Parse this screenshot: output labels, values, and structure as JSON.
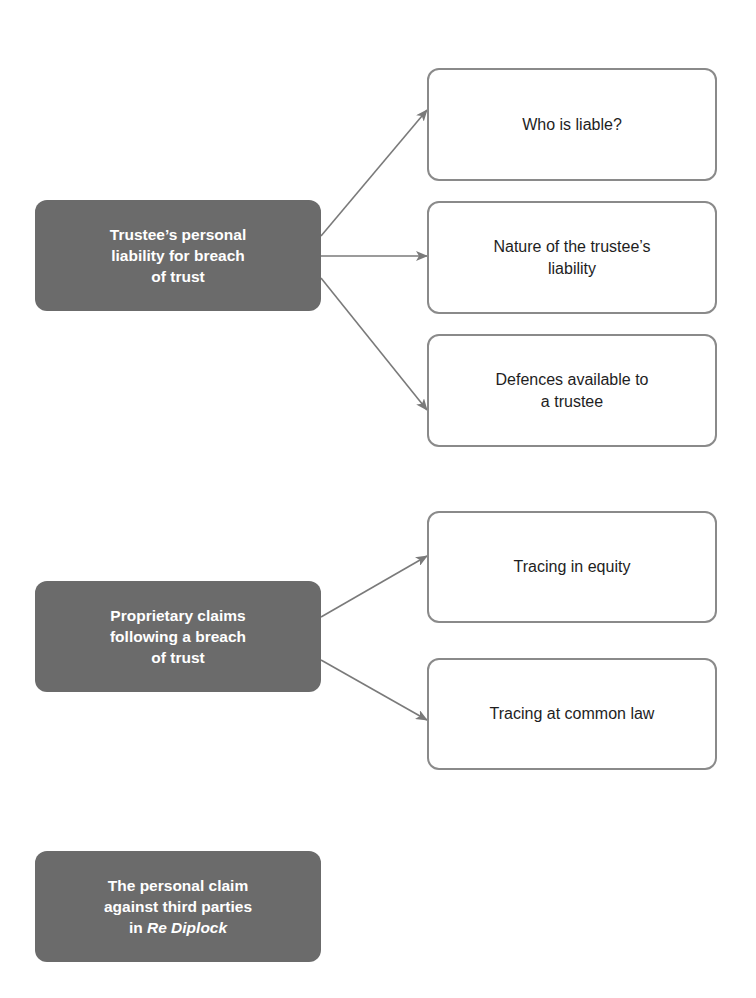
{
  "colors": {
    "dark_node": "#6b6b6b",
    "light_border": "#8a8a8a",
    "arrow": "#7a7a7a"
  },
  "groups": [
    {
      "main": {
        "lines": [
          "Trustee’s personal",
          "liability for breach",
          "of trust"
        ]
      },
      "children": [
        {
          "lines": [
            "Who is liable?"
          ]
        },
        {
          "lines": [
            "Nature of the trustee’s",
            "liability"
          ]
        },
        {
          "lines": [
            "Defences available to",
            "a trustee"
          ]
        }
      ]
    },
    {
      "main": {
        "lines": [
          "Proprietary claims",
          "following a breach",
          "of trust"
        ]
      },
      "children": [
        {
          "lines": [
            "Tracing in equity"
          ]
        },
        {
          "lines": [
            "Tracing at common law"
          ]
        }
      ]
    },
    {
      "main": {
        "lines": [
          "The personal claim",
          "against third parties"
        ],
        "line3_prefix": "in ",
        "line3_italic": "Re Diplock"
      },
      "children": []
    }
  ]
}
